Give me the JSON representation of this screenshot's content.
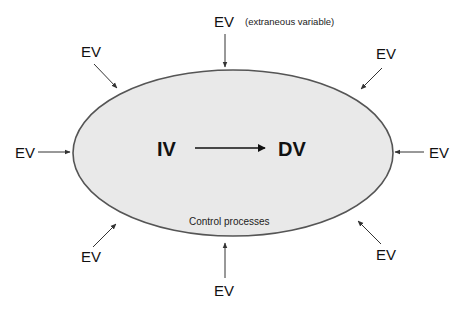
{
  "diagram": {
    "center": {
      "iv_label": "IV",
      "dv_label": "DV",
      "region_label": "Control processes"
    },
    "ev_note": "(extraneous variable)",
    "ev_labels": {
      "top": "EV",
      "top_left": "EV",
      "top_right": "EV",
      "left": "EV",
      "right": "EV",
      "bottom_left": "EV",
      "bottom_right": "EV",
      "bottom": "EV"
    },
    "colors": {
      "ellipse_fill": "#e9e9e9",
      "ellipse_stroke": "#555555",
      "arrow": "#333333",
      "text": "#111111"
    }
  }
}
